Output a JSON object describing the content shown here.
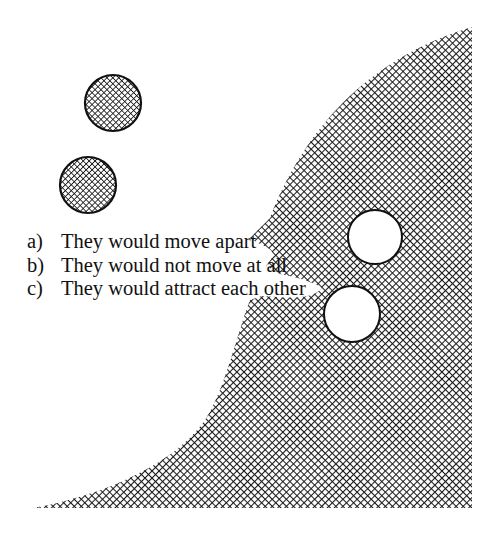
{
  "figure": {
    "colors": {
      "ink": "#111111",
      "background": "#ffffff",
      "hatch": "#1a1a1a"
    },
    "hatched_circles": [
      {
        "cx": 113,
        "cy": 103,
        "r": 28
      },
      {
        "cx": 88,
        "cy": 185,
        "r": 28
      }
    ],
    "white_circles": [
      {
        "cx": 375,
        "cy": 237,
        "r": 27
      },
      {
        "cx": 352,
        "cy": 314,
        "r": 28
      }
    ]
  },
  "options": [
    {
      "letter": "a)",
      "text": "They would move apart"
    },
    {
      "letter": "b)",
      "text": "They would not move at all"
    },
    {
      "letter": "c)",
      "text": "They would attract each other"
    }
  ]
}
